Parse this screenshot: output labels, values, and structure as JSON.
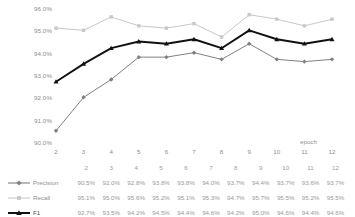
{
  "chart_data": {
    "type": "line",
    "title": "",
    "xlabel": "epoch",
    "ylabel": "",
    "categories": [
      2,
      3,
      4,
      5,
      6,
      7,
      8,
      9,
      10,
      11,
      12
    ],
    "x_tick_labels": [
      "2",
      "3",
      "4",
      "5",
      "6",
      "7",
      "8",
      "9",
      "10",
      "11",
      "12"
    ],
    "y_tick_labels": [
      "96.0%",
      "95.0%",
      "94.0%",
      "93.0%",
      "92.0%",
      "91.0%",
      "90.0%"
    ],
    "y_ticks": [
      96.0,
      95.0,
      94.0,
      93.0,
      92.0,
      91.0,
      90.0
    ],
    "ylim": [
      90.0,
      96.0
    ],
    "grid": false,
    "legend_position": "bottom-left-table",
    "series": [
      {
        "name": "Precision",
        "marker": "diamond",
        "color": "#808080",
        "values": [
          90.5,
          92.0,
          92.8,
          93.8,
          93.8,
          94.0,
          93.7,
          94.4,
          93.7,
          93.6,
          93.7
        ],
        "labels": [
          "90.5%",
          "92.0%",
          "92.8%",
          "93.8%",
          "93.8%",
          "94.0%",
          "93.7%",
          "94.4%",
          "93.7%",
          "93.6%",
          "93.7%"
        ]
      },
      {
        "name": "Recall",
        "marker": "square",
        "color": "#c8c8c8",
        "values": [
          95.1,
          95.0,
          95.6,
          95.2,
          95.1,
          95.3,
          94.7,
          95.7,
          95.5,
          95.2,
          95.5
        ],
        "labels": [
          "95.1%",
          "95.0%",
          "95.6%",
          "95.2%",
          "95.1%",
          "95.3%",
          "94.7%",
          "95.7%",
          "95.5%",
          "95.2%",
          "95.5%"
        ]
      },
      {
        "name": "F1",
        "marker": "triangle",
        "color": "#111111",
        "values": [
          92.7,
          93.5,
          94.2,
          94.5,
          94.4,
          94.6,
          94.2,
          95.0,
          94.6,
          94.4,
          94.6
        ],
        "labels": [
          "92.7%",
          "93.5%",
          "94.2%",
          "94.5%",
          "94.4%",
          "94.6%",
          "94.2%",
          "95.0%",
          "94.6%",
          "94.4%",
          "94.6%"
        ]
      }
    ]
  }
}
